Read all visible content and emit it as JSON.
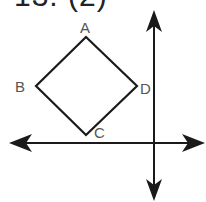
{
  "header": {
    "problem_label": "13. (2)"
  },
  "diagram": {
    "colors": {
      "stroke": "#1a1a1a",
      "label": "#555555",
      "background": "#ffffff"
    },
    "square": {
      "vertices": {
        "A": {
          "label": "A",
          "x": 86,
          "y": 37
        },
        "B": {
          "label": "B",
          "x": 36,
          "y": 86
        },
        "C": {
          "label": "C",
          "x": 86,
          "y": 135
        },
        "D": {
          "label": "D",
          "x": 137,
          "y": 86
        }
      }
    },
    "axes": {
      "horizontal": {
        "y": 143,
        "x_start": 9,
        "x_end": 205
      },
      "vertical": {
        "x": 154,
        "y_start": 12,
        "y_end": 200
      }
    }
  }
}
